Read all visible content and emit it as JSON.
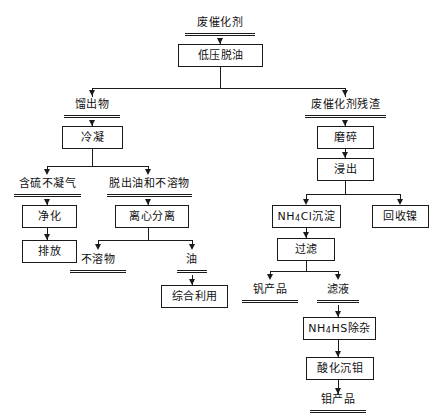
{
  "diagram": {
    "nodes": {
      "spent_catalyst": "废催化剂",
      "low_pressure_deoiling": "低压脱油",
      "distillate": "馏出物",
      "condensation": "冷凝",
      "sulfur_noncondensable_gas": "含硫不凝气",
      "purification": "净化",
      "discharge": "排放",
      "removed_oil_and_insolubles": "脱出油和不溶物",
      "centrifugal_separation": "离心分离",
      "insolubles": "不溶物",
      "oil": "油",
      "comprehensive_utilization": "综合利用",
      "spent_catalyst_residue": "废催化剂残渣",
      "grinding": "磨碎",
      "leaching": "浸出",
      "nh4cl_precipitation_prefix": "NH",
      "nh4cl_precipitation_sub": "4",
      "nh4cl_precipitation_suffix": "Cl沉淀",
      "nickel_recovery": "回收镍",
      "filtration": "过滤",
      "vanadium_product": "钒产品",
      "filtrate": "滤液",
      "nh4hs_impurity_removal_prefix": "NH",
      "nh4hs_impurity_removal_sub": "4",
      "nh4hs_impurity_removal_suffix": "HS除杂",
      "acidification_mo_precipitation": "酸化沉钼",
      "molybdenum_product": "钼产品"
    }
  }
}
